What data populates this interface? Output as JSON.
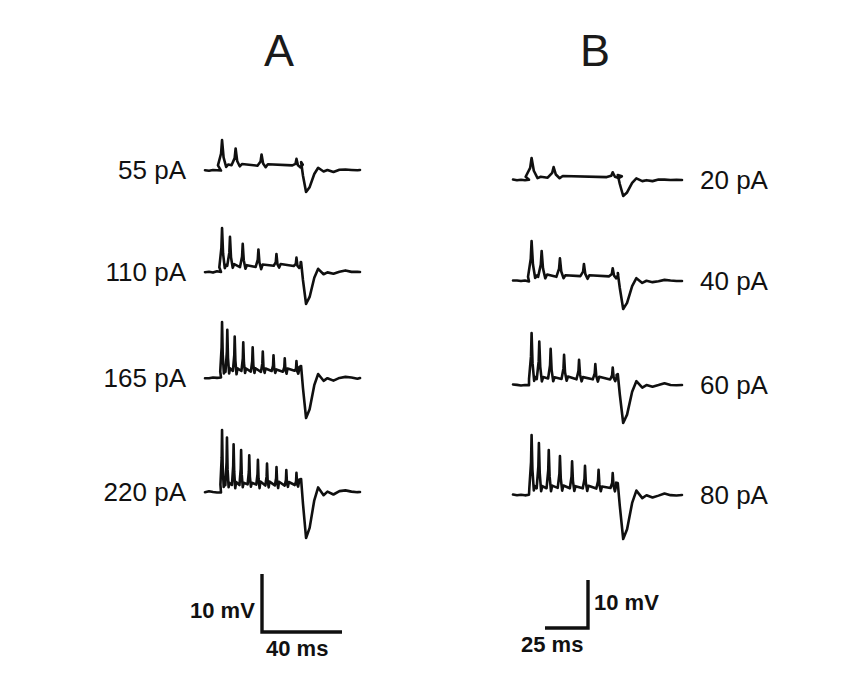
{
  "figure": {
    "background_color": "#ffffff",
    "ink_color": "#101010",
    "panels": [
      {
        "id": "A",
        "letter": "A",
        "label_side": "left"
      },
      {
        "id": "B",
        "letter": "B",
        "label_side": "right"
      }
    ]
  },
  "panel_a": {
    "letter": "A",
    "traces": [
      {
        "label": "55 pA",
        "current_pA": 55,
        "spike_count": 4,
        "first_spike_height": 30,
        "damping": 0.72,
        "plateau_level": 8,
        "ahp_depth": 22,
        "baseline_y": 170
      },
      {
        "label": "110 pA",
        "current_pA": 110,
        "spike_count": 6,
        "first_spike_height": 44,
        "damping": 0.8,
        "plateau_level": 10,
        "ahp_depth": 32,
        "baseline_y": 272
      },
      {
        "label": "165 pA",
        "current_pA": 165,
        "spike_count": 9,
        "first_spike_height": 56,
        "damping": 0.86,
        "plateau_level": 12,
        "ahp_depth": 40,
        "baseline_y": 378
      },
      {
        "label": "220 pA",
        "current_pA": 220,
        "spike_count": 10,
        "first_spike_height": 62,
        "damping": 0.88,
        "plateau_level": 13,
        "ahp_depth": 46,
        "baseline_y": 492
      }
    ],
    "scale_bar": {
      "voltage_label": "10 mV",
      "time_label": "40 ms",
      "orientation": "corner-left",
      "corner_x": 262,
      "top_y": 574,
      "bottom_y": 632,
      "right_x": 342
    }
  },
  "panel_b": {
    "letter": "B",
    "traces": [
      {
        "label": "20 pA",
        "current_pA": 20,
        "spike_count": 3,
        "first_spike_height": 22,
        "damping": 0.55,
        "plateau_level": 5,
        "ahp_depth": 16,
        "baseline_y": 180
      },
      {
        "label": "40 pA",
        "current_pA": 40,
        "spike_count": 5,
        "first_spike_height": 40,
        "damping": 0.74,
        "plateau_level": 8,
        "ahp_depth": 28,
        "baseline_y": 281
      },
      {
        "label": "60 pA",
        "current_pA": 60,
        "spike_count": 7,
        "first_spike_height": 52,
        "damping": 0.84,
        "plateau_level": 11,
        "ahp_depth": 38,
        "baseline_y": 385
      },
      {
        "label": "80 pA",
        "current_pA": 80,
        "spike_count": 8,
        "first_spike_height": 60,
        "damping": 0.88,
        "plateau_level": 12,
        "ahp_depth": 44,
        "baseline_y": 495
      }
    ],
    "scale_bar": {
      "voltage_label": "10 mV",
      "time_label": "25 ms",
      "orientation": "corner-right",
      "corner_x": 588,
      "top_y": 580,
      "bottom_y": 628,
      "left_x": 545
    }
  },
  "chart_data": {
    "type": "line",
    "title": "",
    "xlabel": "",
    "ylabel": "",
    "units": {
      "x": "ms",
      "y": "mV",
      "stimulus": "pA"
    },
    "series": [
      {
        "name": "55 pA",
        "panel": "A",
        "stimulus_pA": 55,
        "spikes": 4,
        "adaptation": "strong"
      },
      {
        "name": "110 pA",
        "panel": "A",
        "stimulus_pA": 110,
        "spikes": 6,
        "adaptation": "strong"
      },
      {
        "name": "165 pA",
        "panel": "A",
        "stimulus_pA": 165,
        "spikes": 9,
        "adaptation": "moderate"
      },
      {
        "name": "220 pA",
        "panel": "A",
        "stimulus_pA": 220,
        "spikes": 10,
        "adaptation": "moderate"
      },
      {
        "name": "20 pA",
        "panel": "B",
        "stimulus_pA": 20,
        "spikes": 3,
        "adaptation": "strong"
      },
      {
        "name": "40 pA",
        "panel": "B",
        "stimulus_pA": 40,
        "spikes": 5,
        "adaptation": "strong"
      },
      {
        "name": "60 pA",
        "panel": "B",
        "stimulus_pA": 60,
        "spikes": 7,
        "adaptation": "moderate"
      },
      {
        "name": "80 pA",
        "panel": "B",
        "stimulus_pA": 80,
        "spikes": 8,
        "adaptation": "moderate"
      }
    ],
    "scale_bars": [
      {
        "panel": "A",
        "voltage": "10 mV",
        "time": "40 ms"
      },
      {
        "panel": "B",
        "voltage": "10 mV",
        "time": "25 ms"
      }
    ],
    "legend_position": "none",
    "grid": false,
    "axes_visible": false
  }
}
